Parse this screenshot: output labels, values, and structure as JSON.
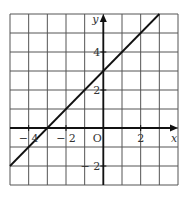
{
  "chart_data": {
    "type": "line",
    "title": "",
    "xlabel": "x",
    "ylabel": "y",
    "origin_label": "O",
    "xlim": [
      -5,
      4
    ],
    "ylim": [
      -3,
      6
    ],
    "grid": true,
    "grid_step": 1,
    "x_tick_labels": [
      {
        "value": -4,
        "label": "− 4"
      },
      {
        "value": -2,
        "label": "− 2"
      },
      {
        "value": 2,
        "label": "2"
      }
    ],
    "y_tick_labels": [
      {
        "value": 4,
        "label": "4"
      },
      {
        "value": 2,
        "label": "2"
      },
      {
        "value": -2,
        "label": "− 2"
      }
    ],
    "series": [
      {
        "name": "y = x + 3",
        "x": [
          -5,
          3
        ],
        "y": [
          -2,
          6
        ]
      }
    ],
    "colors": {
      "grid": "#555555",
      "axis": "#111111",
      "line": "#111111"
    }
  }
}
